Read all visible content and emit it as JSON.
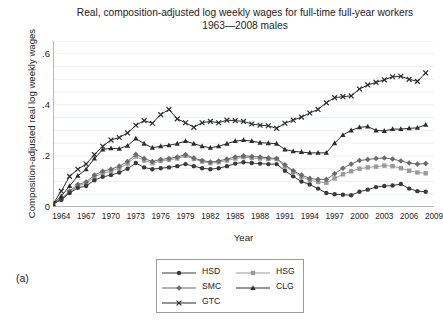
{
  "figure": {
    "panel_label": "(a)",
    "title_line1": "Real, composition-adjusted log weekly wages for full-time full-year workers",
    "title_line2": "1963—2008 males"
  },
  "chart_data": {
    "type": "line",
    "title": "Real, composition-adjusted log weekly wages for full-time full-year workers 1963—2008 males",
    "xlabel": "Year",
    "ylabel": "Composition-adjusted real log weekly wages",
    "xlim": [
      1963,
      2009
    ],
    "ylim": [
      0,
      0.65
    ],
    "xticks": [
      1964,
      1967,
      1970,
      1973,
      1976,
      1979,
      1982,
      1985,
      1988,
      1991,
      1994,
      1997,
      2000,
      2003,
      2006,
      2009
    ],
    "xtick_labels": [
      "1964",
      "1967",
      "1970",
      "1973",
      "1976",
      "1979",
      "1982",
      "1985",
      "1988",
      "1991",
      "1994",
      "1997",
      "2000",
      "2003",
      "2006",
      "2009"
    ],
    "yticks": [
      0,
      0.2,
      0.4,
      0.6
    ],
    "ytick_labels": [
      "0",
      ".2",
      ".4",
      ".6"
    ],
    "yminor_step": 0.05,
    "grid": "horizontal-minor",
    "legend_position": "bottom-center",
    "x": [
      1963,
      1964,
      1965,
      1966,
      1967,
      1968,
      1969,
      1970,
      1971,
      1972,
      1973,
      1974,
      1975,
      1976,
      1977,
      1978,
      1979,
      1980,
      1981,
      1982,
      1983,
      1984,
      1985,
      1986,
      1987,
      1988,
      1989,
      1990,
      1991,
      1992,
      1993,
      1994,
      1995,
      1996,
      1997,
      1998,
      1999,
      2000,
      2001,
      2002,
      2003,
      2004,
      2005,
      2006,
      2007,
      2008
    ],
    "series": [
      {
        "name": "HSD",
        "label": "HSD",
        "marker": "circle",
        "color": "#3a3a3a",
        "values": [
          0.012,
          0.028,
          0.055,
          0.075,
          0.082,
          0.105,
          0.118,
          0.125,
          0.135,
          0.15,
          0.172,
          0.155,
          0.148,
          0.152,
          0.155,
          0.16,
          0.168,
          0.16,
          0.152,
          0.148,
          0.152,
          0.16,
          0.17,
          0.175,
          0.172,
          0.17,
          0.168,
          0.168,
          0.142,
          0.12,
          0.1,
          0.088,
          0.072,
          0.055,
          0.05,
          0.048,
          0.046,
          0.06,
          0.068,
          0.078,
          0.082,
          0.084,
          0.09,
          0.072,
          0.062,
          0.06
        ]
      },
      {
        "name": "HSG",
        "label": "HSG",
        "marker": "square",
        "color": "#9a9a9a",
        "values": [
          0.012,
          0.03,
          0.058,
          0.082,
          0.092,
          0.118,
          0.132,
          0.14,
          0.152,
          0.17,
          0.198,
          0.182,
          0.172,
          0.18,
          0.185,
          0.19,
          0.2,
          0.188,
          0.178,
          0.172,
          0.175,
          0.182,
          0.19,
          0.195,
          0.192,
          0.19,
          0.188,
          0.188,
          0.16,
          0.138,
          0.118,
          0.105,
          0.098,
          0.095,
          0.112,
          0.128,
          0.14,
          0.15,
          0.155,
          0.158,
          0.162,
          0.16,
          0.152,
          0.142,
          0.135,
          0.132
        ]
      },
      {
        "name": "SMC",
        "label": "SMC",
        "marker": "diamond",
        "color": "#6b6b6b",
        "values": [
          0.012,
          0.032,
          0.062,
          0.088,
          0.098,
          0.125,
          0.14,
          0.148,
          0.16,
          0.178,
          0.206,
          0.19,
          0.178,
          0.186,
          0.19,
          0.196,
          0.205,
          0.192,
          0.182,
          0.176,
          0.18,
          0.188,
          0.196,
          0.2,
          0.198,
          0.196,
          0.192,
          0.19,
          0.165,
          0.142,
          0.125,
          0.112,
          0.108,
          0.108,
          0.13,
          0.152,
          0.168,
          0.182,
          0.186,
          0.19,
          0.192,
          0.188,
          0.18,
          0.172,
          0.168,
          0.17
        ]
      },
      {
        "name": "CLG",
        "label": "CLG",
        "marker": "triangle",
        "color": "#2b2b2b",
        "values": [
          0.012,
          0.042,
          0.082,
          0.122,
          0.148,
          0.19,
          0.225,
          0.23,
          0.228,
          0.24,
          0.268,
          0.248,
          0.232,
          0.238,
          0.242,
          0.248,
          0.258,
          0.248,
          0.238,
          0.232,
          0.238,
          0.248,
          0.258,
          0.262,
          0.258,
          0.252,
          0.25,
          0.248,
          0.225,
          0.218,
          0.215,
          0.212,
          0.212,
          0.212,
          0.25,
          0.282,
          0.3,
          0.312,
          0.315,
          0.3,
          0.298,
          0.305,
          0.305,
          0.308,
          0.31,
          0.322
        ]
      },
      {
        "name": "GTC",
        "label": "GTC",
        "marker": "x",
        "color": "#2b2b2b",
        "values": [
          0.012,
          0.062,
          0.12,
          0.148,
          0.168,
          0.205,
          0.238,
          0.262,
          0.272,
          0.29,
          0.32,
          0.338,
          0.328,
          0.362,
          0.382,
          0.345,
          0.33,
          0.312,
          0.33,
          0.335,
          0.33,
          0.34,
          0.338,
          0.335,
          0.325,
          0.32,
          0.318,
          0.308,
          0.328,
          0.34,
          0.352,
          0.368,
          0.382,
          0.408,
          0.428,
          0.432,
          0.435,
          0.462,
          0.478,
          0.488,
          0.498,
          0.51,
          0.512,
          0.5,
          0.492,
          0.525
        ]
      }
    ]
  }
}
